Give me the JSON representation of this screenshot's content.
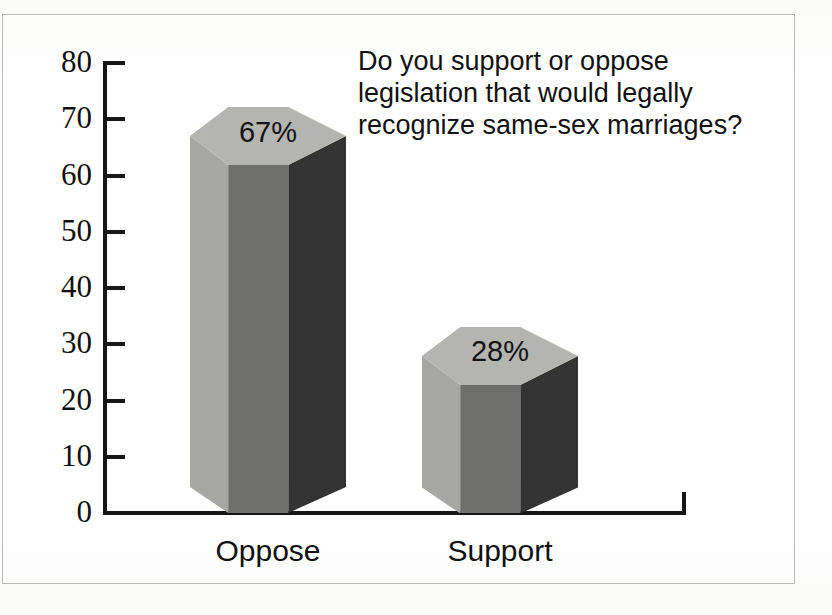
{
  "figure": {
    "caption_question": "Do you support or oppose\nlegislation that would legally\nrecognize same-sex marriages?",
    "background_color": "#fdfdfc",
    "frame_color": "#b9b9b6",
    "axis_color": "#161616"
  },
  "chart_data": {
    "type": "bar",
    "title": "Do you support or oppose legislation that would legally recognize same-sex marriages?",
    "subtitle": "",
    "categories": [
      "Oppose",
      "Support"
    ],
    "values": [
      67,
      28
    ],
    "value_labels": [
      "67%",
      "28%"
    ],
    "xlabel": "",
    "ylabel": "",
    "ylim": [
      0,
      80
    ],
    "ytick_labels": [
      "80",
      "70",
      "60",
      "50",
      "40",
      "30",
      "20",
      "10",
      "0"
    ],
    "ytick_values": [
      80,
      70,
      60,
      50,
      40,
      30,
      20,
      10,
      0
    ],
    "grid": false,
    "legend": false,
    "units": "percent",
    "style": "3d-hexagonal-prism-bars",
    "series": [
      {
        "name": "Response share",
        "values": [
          67,
          28
        ]
      }
    ],
    "bar_colors": {
      "left_face": "#a6a6a3",
      "front_face": "#6e6e6b",
      "right_face": "#333333",
      "cap_light": "#b4b4b1",
      "cap_shadow": "#8e8e8b"
    }
  }
}
